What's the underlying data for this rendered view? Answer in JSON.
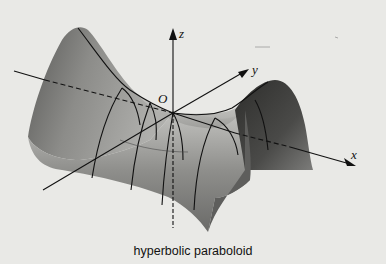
{
  "figure": {
    "caption": "hyperbolic paraboloid",
    "axes": {
      "x_label": "x",
      "y_label": "y",
      "z_label": "z",
      "origin_label": "O"
    },
    "colors": {
      "background": "#e9e9e6",
      "surface_light": "#b9b9b6",
      "surface_dark": "#3a3a38",
      "lines": "#111111"
    }
  }
}
